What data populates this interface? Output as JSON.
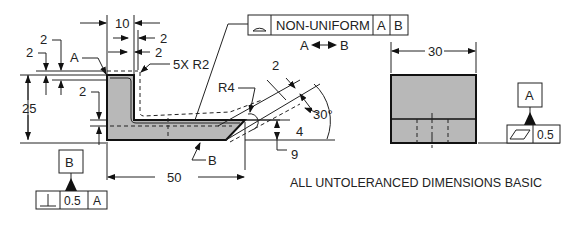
{
  "drawing": {
    "fcf_profile": {
      "symbol": "profile-of-surface-icon",
      "label": "NON-UNIFORM",
      "datum1": "A",
      "datum2": "B",
      "between": {
        "from": "A",
        "to": "B"
      }
    },
    "dims": {
      "top_width": "10",
      "inner_2a": "2",
      "inner_2b": "2",
      "left_2a": "2",
      "left_2b": "2",
      "left_2c": "2",
      "height": "25",
      "radius_note": "5X R2",
      "radius4": "R4",
      "length": "50",
      "angle": "30°",
      "slope_2": "2",
      "slope_4": "4",
      "slope_9": "9",
      "side_width": "30"
    },
    "labels": {
      "point_a": "A",
      "point_b": "B"
    },
    "datum_b": {
      "letter": "B",
      "fcf_symbol": "perpendicularity-icon",
      "tol": "0.5",
      "ref": "A"
    },
    "datum_a": {
      "letter": "A",
      "fcf_symbol": "flatness-icon",
      "tol": "0.5"
    },
    "note": "ALL UNTOLERANCED DIMENSIONS BASIC"
  }
}
